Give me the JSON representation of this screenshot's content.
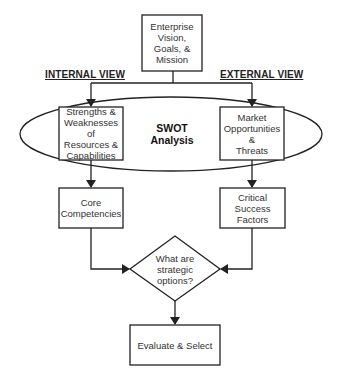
{
  "diagram": {
    "top": {
      "text": "Enterprise\nVision,\nGoals, &\nMission"
    },
    "views": {
      "internal": "INTERNAL VIEW",
      "external": "EXTERNAL VIEW"
    },
    "swot": {
      "text": "SWOT\nAnalysis"
    },
    "left_box": {
      "text": "Strengths &\nWeaknesses of\nResources &\nCapabilities"
    },
    "right_box": {
      "text": "Market\nOpportunities &\nThreats"
    },
    "core": {
      "text": "Core\nCompetencies"
    },
    "csf": {
      "text": "Critical Success\nFactors"
    },
    "decision": {
      "text": "What are\nstrategic\noptions?"
    },
    "final": {
      "text": "Evaluate & Select"
    },
    "colors": {
      "stroke": "#222222",
      "background": "#ffffff"
    }
  }
}
